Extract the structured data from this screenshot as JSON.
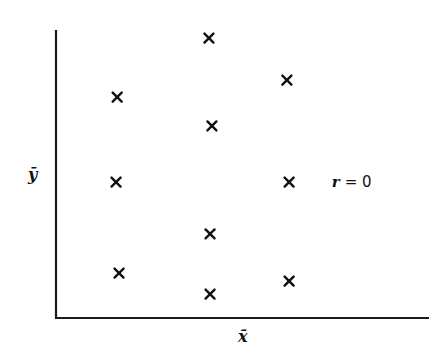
{
  "chart_data": {
    "type": "scatter",
    "title": "",
    "xlabel": "x̄",
    "ylabel": "ȳ",
    "xlim": [
      0,
      10
    ],
    "ylim": [
      0,
      10
    ],
    "grid": false,
    "ticks": false,
    "marker": "x",
    "series": [
      {
        "name": "points",
        "points": [
          {
            "x": 1.64,
            "y": 7.67
          },
          {
            "x": 4.1,
            "y": 9.72
          },
          {
            "x": 4.18,
            "y": 6.67
          },
          {
            "x": 6.19,
            "y": 8.26
          },
          {
            "x": 1.61,
            "y": 4.72
          },
          {
            "x": 6.25,
            "y": 4.72
          },
          {
            "x": 4.13,
            "y": 2.92
          },
          {
            "x": 1.69,
            "y": 1.56
          },
          {
            "x": 4.13,
            "y": 0.83
          },
          {
            "x": 6.25,
            "y": 1.28
          }
        ]
      }
    ],
    "annotations": [
      {
        "text_var": "r",
        "text_eq": "= 0",
        "x": 7.5,
        "y": 4.72
      }
    ]
  }
}
